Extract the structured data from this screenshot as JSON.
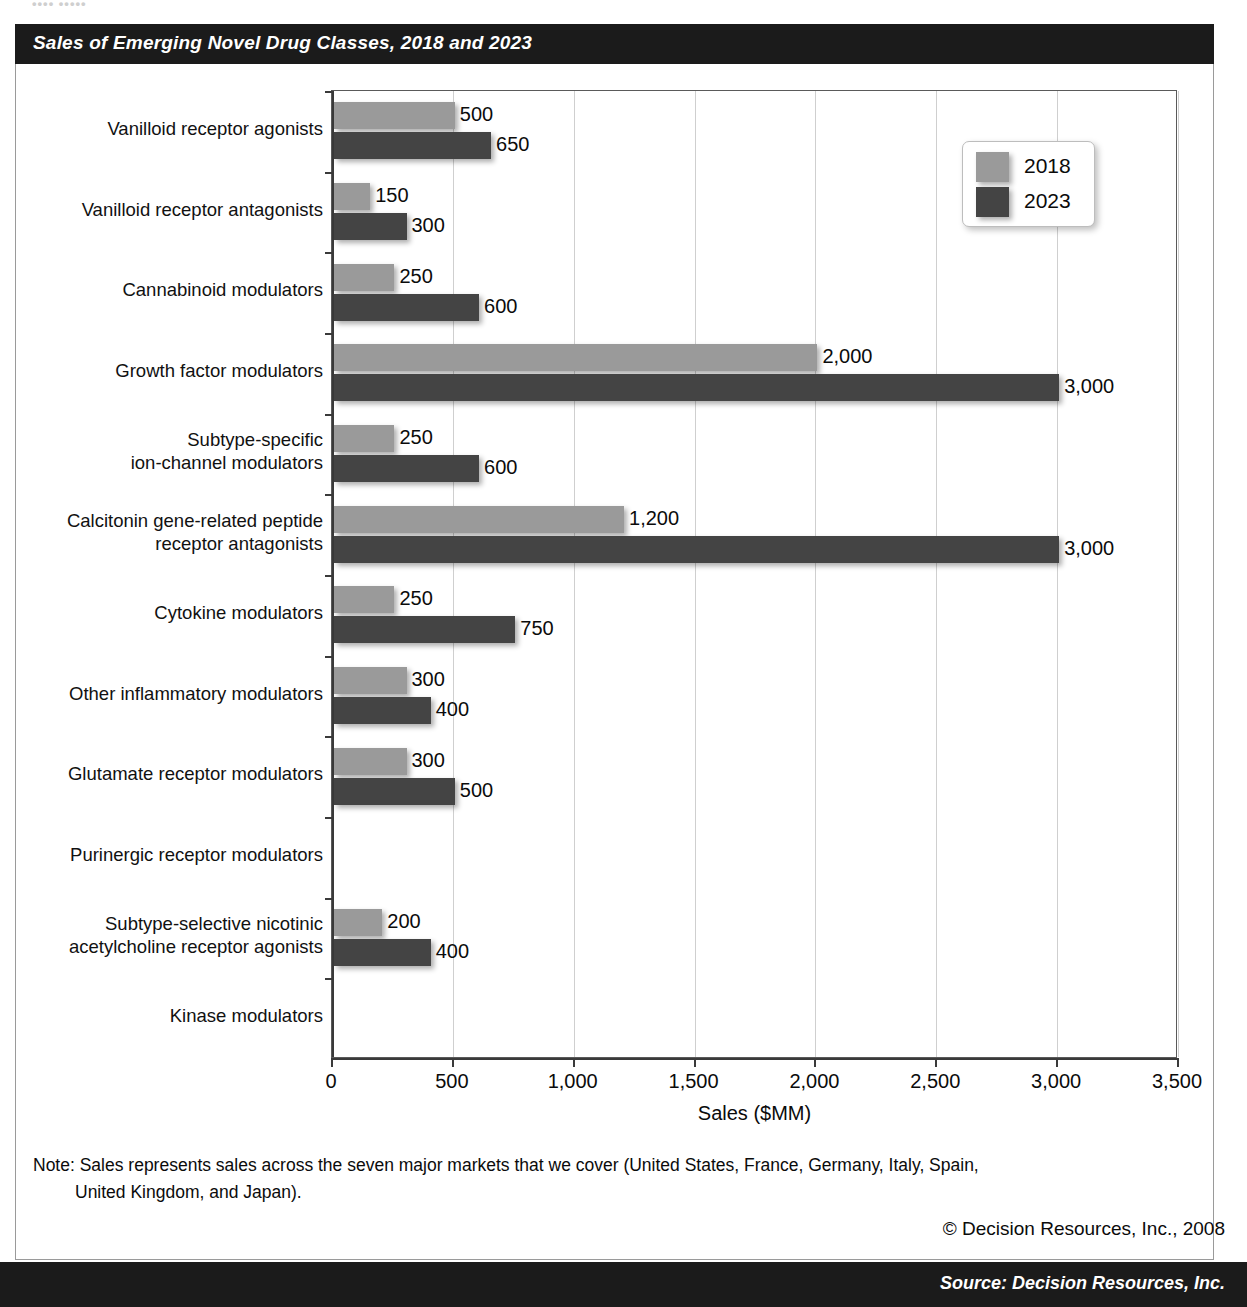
{
  "header": {
    "title": "Sales of Emerging Novel Drug Classes, 2018 and 2023",
    "top_fragment": "•••• •••••"
  },
  "legend": {
    "position": "top-right",
    "entries": [
      {
        "label": "2018",
        "color": "#9a9a9a",
        "swatch": "legend-swatch-2018"
      },
      {
        "label": "2023",
        "color": "#444444",
        "swatch": "legend-swatch-2023"
      }
    ]
  },
  "footer": {
    "note": "Note: Sales represents sales across the seven major markets that we cover (United States, France, Germany, Italy, Spain,",
    "note_continued": "United Kingdom, and Japan).",
    "copyright": "© Decision Resources, Inc., 2008",
    "source": "Source: Decision Resources, Inc."
  },
  "colors": {
    "series_2018": "#9a9a9a",
    "series_2023": "#444444",
    "banner": "#1b1b1b",
    "gridline": "#cfcfcf",
    "axis": "#3a3a3a",
    "panel_border": "#9a9a9a",
    "text": "#0b0b0b"
  },
  "chart_data": {
    "type": "bar",
    "orientation": "horizontal",
    "title": "Sales of Emerging Novel Drug Classes, 2018 and 2023",
    "xlabel": "Sales ($MM)",
    "ylabel": "",
    "xlim": [
      0,
      3500
    ],
    "xticks": [
      0,
      500,
      1000,
      1500,
      2000,
      2500,
      3000,
      3500
    ],
    "xticklabels": [
      "0",
      "500",
      "1,000",
      "1,500",
      "2,000",
      "2,500",
      "3,000",
      "3,500"
    ],
    "grid": "vertical",
    "legend_position": "upper right",
    "categories": [
      "Vanilloid receptor agonists",
      "Vanilloid receptor antagonists",
      "Cannabinoid modulators",
      "Growth factor modulators",
      "Subtype-specific\nion-channel modulators",
      "Calcitonin gene-related peptide\nreceptor antagonists",
      "Cytokine modulators",
      "Other inflammatory modulators",
      "Glutamate receptor modulators",
      "Purinergic receptor modulators",
      "Subtype-selective nicotinic\nacetylcholine receptor agonists",
      "Kinase modulators"
    ],
    "series": [
      {
        "name": "2018",
        "color": "#9a9a9a",
        "values": [
          500,
          150,
          250,
          2000,
          250,
          1200,
          250,
          300,
          300,
          0,
          200,
          0
        ],
        "labels": [
          "500",
          "150",
          "250",
          "2,000",
          "250",
          "1,200",
          "250",
          "300",
          "300",
          "",
          "200",
          ""
        ]
      },
      {
        "name": "2023",
        "color": "#444444",
        "values": [
          650,
          300,
          600,
          3000,
          600,
          3000,
          750,
          400,
          500,
          0,
          400,
          0
        ],
        "labels": [
          "650",
          "300",
          "600",
          "3,000",
          "600",
          "3,000",
          "750",
          "400",
          "500",
          "",
          "400",
          ""
        ]
      }
    ]
  }
}
